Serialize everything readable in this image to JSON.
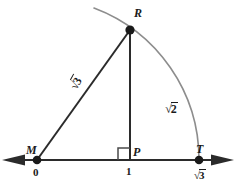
{
  "figure": {
    "type": "geometry-diagram",
    "colors": {
      "line": "#2b2b2b",
      "arc": "#8d8d8d",
      "text": "#1a1a1a",
      "background": "#ffffff"
    },
    "points": [
      {
        "id": "M",
        "label": "M",
        "coord_label": "0",
        "x": 37,
        "y": 160,
        "dot": true
      },
      {
        "id": "P",
        "label": "P",
        "coord_label": "1",
        "x": 130,
        "y": 160,
        "dot": false
      },
      {
        "id": "T",
        "label": "T",
        "coord_label": "3",
        "coord_prefix": "√",
        "x": 199,
        "y": 160,
        "dot": true
      },
      {
        "id": "R",
        "label": "R",
        "coord_label": "",
        "x": 130,
        "y": 30,
        "dot": true
      }
    ],
    "segments": [
      {
        "id": "MR",
        "from": "M",
        "to": "R",
        "length_sign": "√",
        "length_arg": "3"
      },
      {
        "id": "RP",
        "from": "R",
        "to": "P",
        "length_sign": "√",
        "length_arg": "2"
      },
      {
        "id": "MP",
        "from": "M",
        "to": "P",
        "length_arg": ""
      }
    ],
    "labels": {
      "point_M": "M",
      "point_M_coord": "0",
      "point_P": "P",
      "point_P_coord": "1",
      "point_T": "T",
      "point_T_radical_sign": "√",
      "point_T_radical_arg": "3",
      "point_R": "R",
      "side_MR_sign": "√",
      "side_MR_arg": "3",
      "side_RP_sign": "√",
      "side_RP_arg": "2"
    },
    "right_angle": {
      "at": "P",
      "size": 12,
      "orientation": "upper-left"
    },
    "arc": {
      "center": "M",
      "radius": 162,
      "from_deg": 152,
      "to_deg": 0
    },
    "axis": {
      "y": 160,
      "left_arrow": true,
      "right_arrow": true
    }
  }
}
